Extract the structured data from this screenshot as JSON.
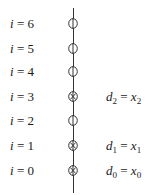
{
  "diagram": {
    "title": "",
    "rows": [
      {
        "var": "i",
        "eq": "=",
        "index": "6",
        "marked": false,
        "annotation": null
      },
      {
        "var": "i",
        "eq": "=",
        "index": "5",
        "marked": false,
        "annotation": null
      },
      {
        "var": "i",
        "eq": "=",
        "index": "4",
        "marked": false,
        "annotation": null
      },
      {
        "var": "i",
        "eq": "=",
        "index": "3",
        "marked": true,
        "annotation": {
          "lhs": "d",
          "lhs_sub": "2",
          "op": "=",
          "rhs": "x",
          "rhs_sub": "2"
        }
      },
      {
        "var": "i",
        "eq": "=",
        "index": "2",
        "marked": false,
        "annotation": null
      },
      {
        "var": "i",
        "eq": "=",
        "index": "1",
        "marked": true,
        "annotation": {
          "lhs": "d",
          "lhs_sub": "1",
          "op": "=",
          "rhs": "x",
          "rhs_sub": "1"
        }
      },
      {
        "var": "i",
        "eq": "=",
        "index": "0",
        "marked": true,
        "annotation": {
          "lhs": "d",
          "lhs_sub": "0",
          "op": "=",
          "rhs": "x",
          "rhs_sub": "0"
        }
      }
    ],
    "node_symbols": {
      "empty": "open-circle",
      "marked": "circle-with-x"
    }
  }
}
